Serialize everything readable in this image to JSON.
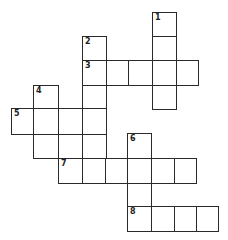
{
  "puzzle": {
    "type": "crossword",
    "cells": [
      {
        "x": 152,
        "y": 12,
        "w": 24,
        "h": 24,
        "num": "1"
      },
      {
        "x": 152,
        "y": 36,
        "w": 24,
        "h": 24,
        "num": ""
      },
      {
        "x": 82,
        "y": 36,
        "w": 24,
        "h": 24,
        "num": "2"
      },
      {
        "x": 82,
        "y": 60,
        "w": 24,
        "h": 25,
        "num": "3"
      },
      {
        "x": 106,
        "y": 60,
        "w": 22,
        "h": 25,
        "num": ""
      },
      {
        "x": 128,
        "y": 60,
        "w": 24,
        "h": 25,
        "num": ""
      },
      {
        "x": 152,
        "y": 60,
        "w": 24,
        "h": 25,
        "num": ""
      },
      {
        "x": 176,
        "y": 60,
        "w": 22,
        "h": 25,
        "num": ""
      },
      {
        "x": 152,
        "y": 85,
        "w": 24,
        "h": 24,
        "num": ""
      },
      {
        "x": 82,
        "y": 85,
        "w": 24,
        "h": 24,
        "num": ""
      },
      {
        "x": 33,
        "y": 85,
        "w": 25,
        "h": 24,
        "num": "4"
      },
      {
        "x": 11,
        "y": 108,
        "w": 22,
        "h": 26,
        "num": "5"
      },
      {
        "x": 33,
        "y": 108,
        "w": 25,
        "h": 26,
        "num": ""
      },
      {
        "x": 58,
        "y": 108,
        "w": 24,
        "h": 26,
        "num": ""
      },
      {
        "x": 82,
        "y": 108,
        "w": 24,
        "h": 26,
        "num": ""
      },
      {
        "x": 33,
        "y": 134,
        "w": 25,
        "h": 24,
        "num": ""
      },
      {
        "x": 58,
        "y": 134,
        "w": 24,
        "h": 24,
        "num": ""
      },
      {
        "x": 82,
        "y": 134,
        "w": 24,
        "h": 24,
        "num": ""
      },
      {
        "x": 127,
        "y": 133,
        "w": 24,
        "h": 25,
        "num": "6"
      },
      {
        "x": 58,
        "y": 158,
        "w": 24,
        "h": 25,
        "num": "7"
      },
      {
        "x": 82,
        "y": 158,
        "w": 23,
        "h": 25,
        "num": ""
      },
      {
        "x": 105,
        "y": 158,
        "w": 22,
        "h": 25,
        "num": ""
      },
      {
        "x": 127,
        "y": 158,
        "w": 24,
        "h": 25,
        "num": ""
      },
      {
        "x": 151,
        "y": 158,
        "w": 23,
        "h": 25,
        "num": ""
      },
      {
        "x": 174,
        "y": 158,
        "w": 22,
        "h": 25,
        "num": ""
      },
      {
        "x": 127,
        "y": 183,
        "w": 24,
        "h": 24,
        "num": ""
      },
      {
        "x": 127,
        "y": 206,
        "w": 24,
        "h": 25,
        "num": "8"
      },
      {
        "x": 151,
        "y": 206,
        "w": 23,
        "h": 25,
        "num": ""
      },
      {
        "x": 174,
        "y": 206,
        "w": 22,
        "h": 25,
        "num": ""
      },
      {
        "x": 196,
        "y": 206,
        "w": 22,
        "h": 25,
        "num": ""
      }
    ],
    "clue_numbers": [
      "1",
      "2",
      "3",
      "4",
      "5",
      "6",
      "7",
      "8"
    ]
  }
}
